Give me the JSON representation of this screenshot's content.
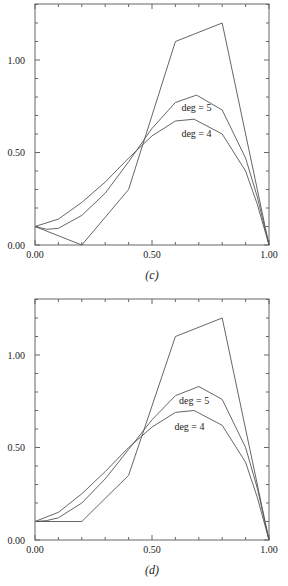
{
  "chart_data": [
    {
      "type": "line",
      "title": "(c)",
      "caption": "(c)",
      "xlabel": "",
      "ylabel": "",
      "xlim": [
        0,
        1
      ],
      "ylim": [
        0,
        1.3
      ],
      "x_tick_labels": [
        "0.00",
        "0.50",
        "1.00"
      ],
      "y_tick_labels": [
        "0.00",
        "0.50",
        "1.00"
      ],
      "grid": false,
      "annotations": [
        {
          "text": "deg = 5",
          "x": 0.69,
          "y": 0.74
        },
        {
          "text": "deg = 4",
          "x": 0.69,
          "y": 0.6
        }
      ],
      "series": [
        {
          "name": "control polygon",
          "x": [
            0,
            0.2,
            0.4,
            0.6,
            0.8,
            1.0
          ],
          "y": [
            0.1,
            0.0,
            0.3,
            1.1,
            1.2,
            0.0
          ]
        },
        {
          "name": "deg = 5",
          "x": [
            0,
            0.05,
            0.1,
            0.2,
            0.3,
            0.4,
            0.5,
            0.6,
            0.69,
            0.8,
            0.9,
            0.95,
            1.0
          ],
          "y": [
            0.1,
            0.085,
            0.09,
            0.16,
            0.28,
            0.45,
            0.63,
            0.77,
            0.81,
            0.73,
            0.47,
            0.26,
            0.0
          ]
        },
        {
          "name": "deg = 4",
          "x": [
            0,
            0.1,
            0.2,
            0.3,
            0.4,
            0.5,
            0.6,
            0.68,
            0.8,
            0.9,
            0.95,
            1.0
          ],
          "y": [
            0.1,
            0.14,
            0.23,
            0.34,
            0.47,
            0.59,
            0.67,
            0.68,
            0.6,
            0.4,
            0.22,
            0.0
          ]
        }
      ]
    },
    {
      "type": "line",
      "title": "(d)",
      "caption": "(d)",
      "xlabel": "",
      "ylabel": "",
      "xlim": [
        0,
        1
      ],
      "ylim": [
        0,
        1.3
      ],
      "x_tick_labels": [
        "0.00",
        "0.50",
        "1.00"
      ],
      "y_tick_labels": [
        "0.00",
        "0.50",
        "1.00"
      ],
      "grid": false,
      "annotations": [
        {
          "text": "deg = 5",
          "x": 0.68,
          "y": 0.75
        },
        {
          "text": "deg = 4",
          "x": 0.66,
          "y": 0.61
        }
      ],
      "series": [
        {
          "name": "control polygon",
          "x": [
            0,
            0.2,
            0.4,
            0.6,
            0.8,
            1.0
          ],
          "y": [
            0.1,
            0.1,
            0.35,
            1.1,
            1.2,
            0.0
          ]
        },
        {
          "name": "deg = 5",
          "x": [
            0,
            0.05,
            0.1,
            0.2,
            0.3,
            0.4,
            0.5,
            0.6,
            0.7,
            0.8,
            0.9,
            0.95,
            1.0
          ],
          "y": [
            0.1,
            0.105,
            0.12,
            0.2,
            0.33,
            0.49,
            0.65,
            0.78,
            0.83,
            0.76,
            0.5,
            0.28,
            0.0
          ]
        },
        {
          "name": "deg = 4",
          "x": [
            0,
            0.1,
            0.2,
            0.3,
            0.4,
            0.5,
            0.6,
            0.68,
            0.8,
            0.9,
            0.95,
            1.0
          ],
          "y": [
            0.1,
            0.15,
            0.25,
            0.37,
            0.5,
            0.61,
            0.69,
            0.7,
            0.62,
            0.42,
            0.23,
            0.0
          ]
        }
      ]
    }
  ],
  "panels": [
    {
      "caption": "(c)",
      "frame": {
        "x": 35,
        "y": 4,
        "w": 234,
        "h": 241
      }
    },
    {
      "caption": "(d)",
      "frame": {
        "x": 35,
        "y": 299,
        "w": 234,
        "h": 241
      }
    }
  ],
  "style": {
    "line_color": "#555555",
    "frame_color": "#666666",
    "text_color": "#222222"
  }
}
